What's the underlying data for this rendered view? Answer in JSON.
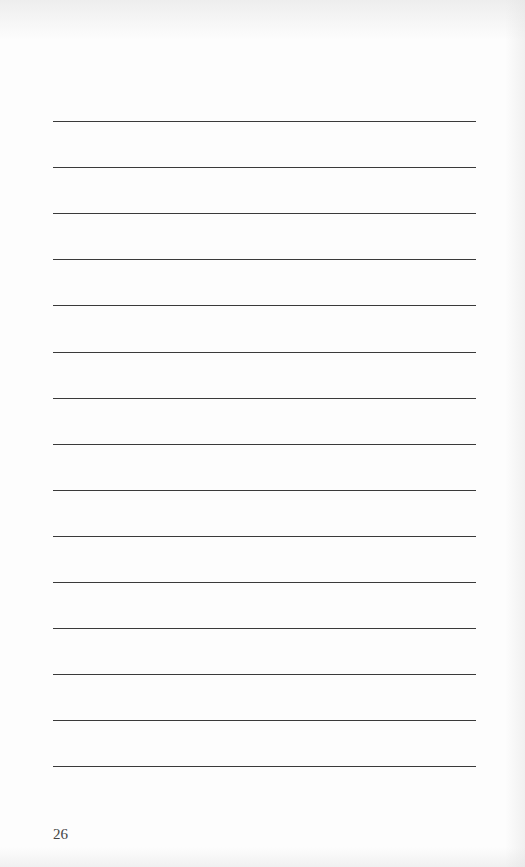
{
  "page": {
    "page_number": "26",
    "ruled_lines": {
      "count": 15,
      "first_y": 121,
      "spacing": 46.1,
      "left": 53,
      "width": 423,
      "color": "#3a3a3a"
    }
  }
}
